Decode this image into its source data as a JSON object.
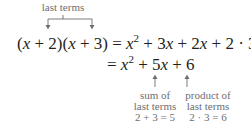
{
  "top_annotation": {
    "label": "last terms"
  },
  "equation": {
    "line1": {
      "lhs": [
        "(",
        "x",
        " + 2)(",
        "x",
        " + 3)"
      ],
      "equals": "=",
      "rhs": {
        "x": "x",
        "exp": "2",
        "rest_a": " + 3",
        "x2": "x",
        "rest_b": " + 2",
        "x3": "x",
        "rest_c": " + 2 · 3"
      }
    },
    "line2": {
      "equals": "=",
      "x": "x",
      "exp": "2",
      "rest_a": " + 5",
      "x2": "x",
      "rest_b": " + 6"
    }
  },
  "annotations": [
    {
      "line1": "sum of",
      "line2": "last terms",
      "line3": "2 + 3 = 5"
    },
    {
      "line1": "product of",
      "line2": "last terms",
      "line3": "2 · 3 = 6"
    }
  ],
  "colors": {
    "text": "#231f20",
    "annotation": "#6d6e71"
  }
}
